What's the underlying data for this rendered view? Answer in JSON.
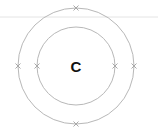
{
  "diagram": {
    "type": "bohr-model",
    "nucleus": {
      "symbol": "C"
    },
    "shells": [
      {
        "name": "inner-shell",
        "electrons": 2,
        "marker": "×"
      },
      {
        "name": "outer-shell",
        "electrons": 4,
        "marker": "×"
      }
    ],
    "colors": {
      "shell_stroke": "#b8b8b8",
      "electron_stroke": "#a8a8a8",
      "rule_line": "#e4e4e4",
      "symbol": "#111111",
      "background": "#ffffff"
    }
  }
}
